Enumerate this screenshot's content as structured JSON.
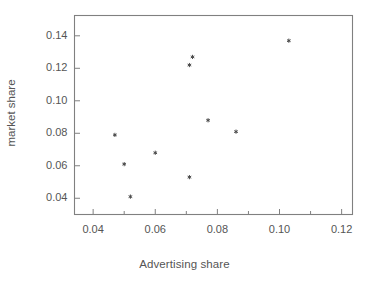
{
  "chart_data": {
    "type": "scatter",
    "title": "",
    "xlabel": "Advertising share",
    "ylabel": "market share",
    "xlim": [
      0.034,
      0.1235
    ],
    "ylim": [
      0.03,
      0.1525
    ],
    "grid": false,
    "legend": null,
    "xticks": [
      "0.04",
      "0.06",
      "0.08",
      "0.10",
      "0.12"
    ],
    "xtick_values": [
      0.04,
      0.06,
      0.08,
      0.1,
      0.12
    ],
    "yticks": [
      "0.04",
      "0.06",
      "0.08",
      "0.10",
      "0.12",
      "0.14"
    ],
    "ytick_values": [
      0.04,
      0.06,
      0.08,
      0.1,
      0.12,
      0.14
    ],
    "marker": "star",
    "marker_color": "#4d4d4d",
    "points": [
      {
        "x": 0.047,
        "y": 0.079
      },
      {
        "x": 0.05,
        "y": 0.061
      },
      {
        "x": 0.052,
        "y": 0.041
      },
      {
        "x": 0.06,
        "y": 0.068
      },
      {
        "x": 0.071,
        "y": 0.053
      },
      {
        "x": 0.071,
        "y": 0.122
      },
      {
        "x": 0.072,
        "y": 0.127
      },
      {
        "x": 0.077,
        "y": 0.088
      },
      {
        "x": 0.086,
        "y": 0.081
      },
      {
        "x": 0.103,
        "y": 0.137
      }
    ],
    "x": [
      0.047,
      0.05,
      0.052,
      0.06,
      0.071,
      0.071,
      0.072,
      0.077,
      0.086,
      0.103
    ],
    "values": [
      0.079,
      0.061,
      0.041,
      0.068,
      0.053,
      0.122,
      0.127,
      0.088,
      0.081,
      0.137
    ],
    "axis_color": "#808080",
    "text_color": "#555555"
  }
}
